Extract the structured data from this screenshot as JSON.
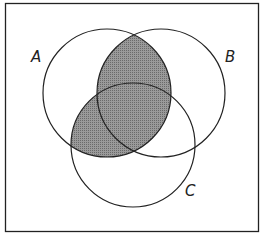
{
  "diagram": {
    "type": "venn",
    "shaded_region": "A ∩ (B ∪ C)",
    "colors": {
      "stroke": "#222222",
      "shade": "#8a8a8a",
      "background": "#ffffff"
    },
    "sets": [
      {
        "name": "A",
        "label": "A"
      },
      {
        "name": "B",
        "label": "B"
      },
      {
        "name": "C",
        "label": "C"
      }
    ]
  }
}
